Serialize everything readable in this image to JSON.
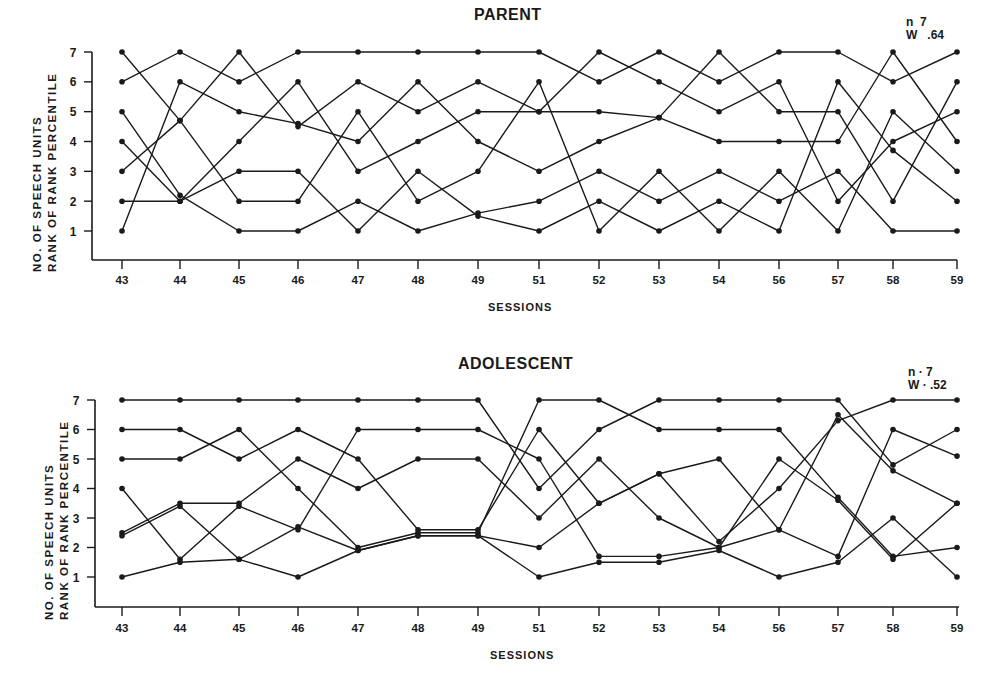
{
  "chart_data": [
    {
      "type": "line",
      "title": "PARENT",
      "xlabel": "SESSIONS",
      "ylabel": [
        "NO. OF SPEECH UNITS",
        "RANK OF RANK PERCENTILE"
      ],
      "annotation": [
        "n = 7",
        "W = .64"
      ],
      "categories": [
        "43",
        "44",
        "45",
        "46",
        "47",
        "48",
        "49",
        "51",
        "52",
        "53",
        "54",
        "56",
        "57",
        "58",
        "59"
      ],
      "yticks": [
        1,
        2,
        3,
        4,
        5,
        6,
        7
      ],
      "ylim": [
        0,
        7
      ],
      "grid": false,
      "legend": "none",
      "series": [
        {
          "name": "S1",
          "values": [
            6,
            7,
            6,
            7,
            7,
            7,
            7,
            7,
            6,
            7,
            6,
            7,
            7,
            6,
            7
          ]
        },
        {
          "name": "S2",
          "values": [
            7,
            4.7,
            2,
            2,
            5,
            2,
            3,
            6,
            1,
            3,
            1,
            3,
            1,
            5,
            3
          ]
        },
        {
          "name": "S3",
          "values": [
            1,
            6,
            5,
            4.6,
            4,
            6,
            4,
            3,
            4,
            4.8,
            7,
            5,
            5,
            2,
            6
          ]
        },
        {
          "name": "S4",
          "values": [
            3,
            4.7,
            7,
            4.5,
            6,
            5,
            6,
            5,
            7,
            6,
            5,
            6,
            2,
            4,
            5
          ]
        },
        {
          "name": "S5",
          "values": [
            5,
            2.2,
            1,
            1,
            2,
            1,
            1.6,
            2,
            3,
            2,
            3,
            2,
            3,
            1,
            1
          ]
        },
        {
          "name": "S6",
          "values": [
            4,
            2,
            3,
            3,
            1,
            3,
            1.5,
            1,
            2,
            1,
            2,
            1,
            6,
            3.7,
            2
          ]
        },
        {
          "name": "S7",
          "values": [
            2,
            2,
            4,
            6,
            3,
            4,
            5,
            5,
            5,
            4.8,
            4,
            4,
            4,
            7,
            4
          ]
        }
      ]
    },
    {
      "type": "line",
      "title": "ADOLESCENT",
      "xlabel": "SESSIONS",
      "ylabel": [
        "NO. OF SPEECH UNITS",
        "RANK OF RANK PERCENTILE"
      ],
      "annotation": [
        "n = 7",
        "W = .52"
      ],
      "categories": [
        "43",
        "44",
        "45",
        "46",
        "47",
        "48",
        "49",
        "51",
        "52",
        "53",
        "54",
        "56",
        "57",
        "58",
        "59"
      ],
      "yticks": [
        1,
        2,
        3,
        4,
        5,
        6,
        7
      ],
      "ylim": [
        0,
        7
      ],
      "grid": false,
      "legend": "none",
      "series": [
        {
          "name": "S1",
          "values": [
            7,
            7,
            7,
            7,
            7,
            7,
            7,
            4,
            6,
            7,
            7,
            7,
            7,
            4.8,
            6
          ]
        },
        {
          "name": "S2",
          "values": [
            6,
            6,
            5,
            6,
            5,
            2.6,
            2.6,
            6,
            3.5,
            4.5,
            2.2,
            4,
            6.3,
            7,
            7
          ]
        },
        {
          "name": "S3",
          "values": [
            5,
            5,
            6,
            4,
            2,
            2.5,
            2.5,
            7,
            7,
            6,
            6,
            6,
            3.7,
            1.7,
            2
          ]
        },
        {
          "name": "S4",
          "values": [
            4,
            1.6,
            3.4,
            2.6,
            6,
            6,
            6,
            5,
            1.7,
            1.7,
            2,
            2.6,
            1.7,
            6,
            5.1
          ]
        },
        {
          "name": "S5",
          "values": [
            2.5,
            3.5,
            3.5,
            5,
            4,
            5,
            5,
            3,
            5,
            3,
            2,
            5,
            3.6,
            1.6,
            3.5
          ]
        },
        {
          "name": "S6",
          "values": [
            2.4,
            3.4,
            1.6,
            2.7,
            1.9,
            2.4,
            2.4,
            2,
            3.5,
            4.5,
            5,
            2.6,
            6.5,
            4.6,
            3.5
          ]
        },
        {
          "name": "S7",
          "values": [
            1,
            1.5,
            1.6,
            1,
            1.9,
            2.4,
            2.4,
            1,
            1.5,
            1.5,
            1.9,
            1,
            1.5,
            3,
            1
          ]
        }
      ]
    }
  ],
  "panels": [
    {
      "title": "PARENT",
      "n_label": "n",
      "n_value": "7",
      "w_label": "W",
      "w_value": ".64",
      "xlabel": "SESSIONS",
      "ylabel_line1": "NO.  OF  SPEECH  UNITS",
      "ylabel_line2": "RANK  OF  RANK  PERCENTILE"
    },
    {
      "title": "ADOLESCENT",
      "n_label": "n",
      "n_value": "7",
      "w_label": "W",
      "w_value": ".52",
      "xlabel": "SESSIONS",
      "ylabel_line1": "NO.  OF  SPEECH  UNITS",
      "ylabel_line2": "RANK  OF  RANK  PERCENTILE"
    }
  ],
  "colors": {
    "ink": "#1a1a1a",
    "background": "#ffffff"
  }
}
